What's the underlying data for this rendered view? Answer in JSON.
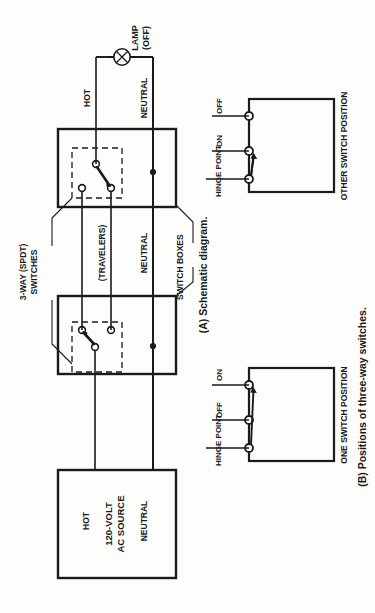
{
  "figure": {
    "orientation": "rotated-90-ccw",
    "background_color": "#fdfdfb",
    "ink_color": "#1a1a1a",
    "panels": [
      {
        "id": "A",
        "caption": "(A) Schematic diagram."
      },
      {
        "id": "B",
        "caption": "(B) Positions of three-way switches."
      }
    ]
  },
  "panel_a": {
    "caption": "(A) Schematic diagram.",
    "source_box": {
      "line1": "120-VOLT",
      "line2": "AC SOURCE"
    },
    "lamp": {
      "line1": "LAMP",
      "line2": "(OFF)",
      "symbol": "lamp-circle-x"
    },
    "wire_labels": {
      "hot_source": "HOT",
      "neutral_source": "NEUTRAL",
      "neutral_mid": "NEUTRAL",
      "hot_lamp": "HOT",
      "neutral_lamp": "NEUTRAL",
      "travelers": "(TRAVELERS)"
    },
    "callouts": {
      "switches": {
        "line1": "3-WAY (SPDT)",
        "line2": "SWITCHES"
      },
      "switch_boxes": "SWITCH BOXES"
    }
  },
  "panel_b": {
    "caption": "(B) Positions of three-way switches.",
    "diagrams": [
      {
        "title": "ONE SWITCH POSITION",
        "hinge_label": "HINGE POINT",
        "terminal_top": "ON",
        "terminal_bottom": "OFF",
        "blade_connects_to": "ON"
      },
      {
        "title": "OTHER SWITCH POSITION",
        "hinge_label": "HINGE POINT",
        "terminal_top": "OFF",
        "terminal_bottom": "ON",
        "blade_connects_to": "ON"
      }
    ]
  }
}
